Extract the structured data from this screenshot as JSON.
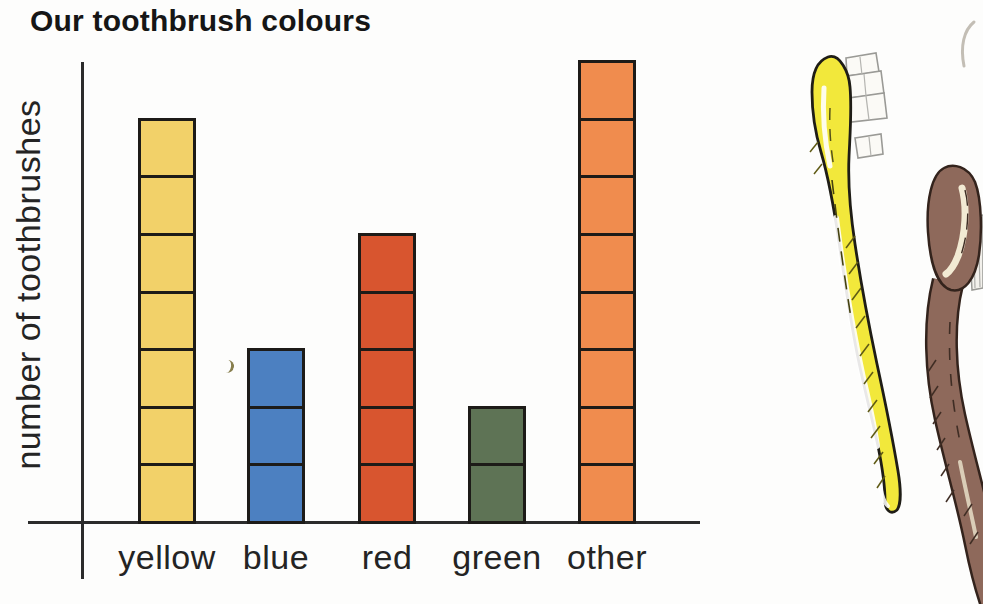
{
  "title": "Our toothbrush colours",
  "chart_data": {
    "type": "bar",
    "title": "Our toothbrush colours",
    "xlabel": "",
    "ylabel": "number of toothbrushes",
    "categories": [
      "yellow",
      "blue",
      "red",
      "green",
      "other"
    ],
    "values": [
      7,
      3,
      5,
      2,
      8
    ],
    "ylim": [
      0,
      8
    ],
    "grid": false,
    "legend": "none",
    "unit_square": "each stacked square = 1 toothbrush",
    "bar_colors": [
      "#F2D169",
      "#4C80C1",
      "#D8552F",
      "#5E7355",
      "#F08C4E"
    ],
    "outline_color": "#1d1b18",
    "axis_color": "#2b2b2b"
  },
  "illustrations": {
    "yellow_toothbrush": {
      "label": "yellow-toothbrush-drawing",
      "body_color": "#F2E83B",
      "bristle_color": "#ffffff"
    },
    "brown_toothbrush": {
      "label": "brown-toothbrush-drawing",
      "body_color": "#8E695B",
      "highlight_color": "#F2EAD3"
    }
  }
}
